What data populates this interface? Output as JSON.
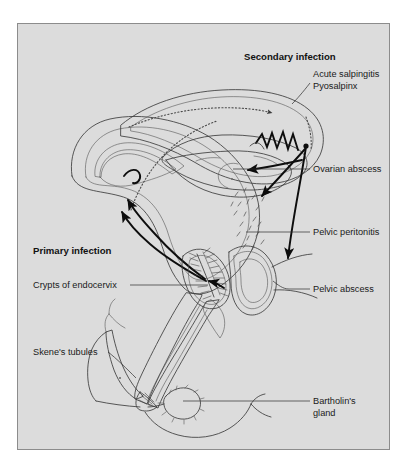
{
  "figure": {
    "kind": "anatomical-diagram",
    "frame": {
      "background_color": "#dcdcdc",
      "border_color": "#8c8c8c",
      "page_background": "#ffffff"
    }
  },
  "headings": [
    {
      "id": "secondary",
      "text": "Secondary infection",
      "x": 244,
      "y": 60
    },
    {
      "id": "primary",
      "text": "Primary infection",
      "x": 33,
      "y": 254
    }
  ],
  "labels": [
    {
      "id": "acute-salpingitis",
      "text": "Acute salpingitis",
      "x": 313,
      "y": 77,
      "anchor": "start"
    },
    {
      "id": "pyosalpinx",
      "text": "Pyosalpinx",
      "x": 313,
      "y": 89,
      "anchor": "start"
    },
    {
      "id": "ovarian-abscess",
      "text": "Ovarian abscess",
      "x": 313,
      "y": 172,
      "anchor": "start"
    },
    {
      "id": "pelvic-peritonitis",
      "text": "Pelvic peritonitis",
      "x": 313,
      "y": 235,
      "anchor": "start"
    },
    {
      "id": "pelvic-abscess",
      "text": "Pelvic abscess",
      "x": 313,
      "y": 292,
      "anchor": "start"
    },
    {
      "id": "crypts-of-endocervix",
      "text": "Crypts of endocervix",
      "x": 33,
      "y": 288,
      "anchor": "start"
    },
    {
      "id": "skenes-tubules",
      "text": "Skene's tubules",
      "x": 33,
      "y": 355,
      "anchor": "start"
    },
    {
      "id": "bartholins-gland-line1",
      "text": "Bartholin's",
      "x": 313,
      "y": 404,
      "anchor": "start"
    },
    {
      "id": "bartholins-gland-line2",
      "text": "gland",
      "x": 313,
      "y": 416,
      "anchor": "start"
    }
  ],
  "structures": [
    {
      "id": "uterus",
      "name": "uterus-body"
    },
    {
      "id": "fallopian-tube",
      "name": "fallopian-tube-pyosalpinx"
    },
    {
      "id": "ovary",
      "name": "ovary-with-abscess"
    },
    {
      "id": "cervix",
      "name": "cervix-with-crypts"
    },
    {
      "id": "vagina",
      "name": "vaginal-canal"
    },
    {
      "id": "pouch-of-douglas",
      "name": "pouch-of-douglas-abscess"
    },
    {
      "id": "bartholin-gland",
      "name": "bartholin-gland-body"
    },
    {
      "id": "skene-tubules",
      "name": "skene-tubules-body"
    },
    {
      "id": "peritoneal-exudate",
      "name": "pelvic-peritonitis-exudate"
    }
  ],
  "flow": {
    "ascending_route_label": "dotted ascending infection route from uterine cavity to tube",
    "arrow_count": 7
  },
  "palette": {
    "tissue_light": "#e9e9e9",
    "tissue_mid": "#cfcfcf",
    "tissue_dark": "#b5b5b5",
    "lumen": "#f2f2f2",
    "ink": "#1a1a1a",
    "outline": "#3c3c3c"
  }
}
